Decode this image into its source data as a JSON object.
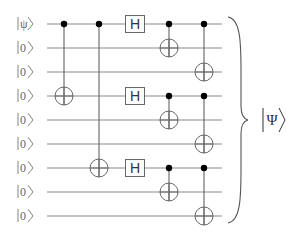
{
  "diagram": {
    "type": "quantum-circuit",
    "wire_y": [
      24,
      48,
      72,
      96,
      120,
      144,
      168,
      192,
      216
    ],
    "wire_x_start": 47,
    "wire_x_end": 222,
    "inputs": [
      "|ψ⟩",
      "|0⟩",
      "|0⟩",
      "|0⟩",
      "|0⟩",
      "|0⟩",
      "|0⟩",
      "|0⟩",
      "|0⟩"
    ],
    "input_label_parts": [
      {
        "sym": "ψ"
      },
      {
        "sym": "0"
      },
      {
        "sym": "0"
      },
      {
        "sym": "0"
      },
      {
        "sym": "0"
      },
      {
        "sym": "0"
      },
      {
        "sym": "0"
      },
      {
        "sym": "0"
      },
      {
        "sym": "0"
      }
    ],
    "columns": [
      {
        "x": 64,
        "gates": [
          {
            "type": "cnot",
            "control": 0,
            "target": 3
          }
        ]
      },
      {
        "x": 99,
        "gates": [
          {
            "type": "cnot",
            "control": 0,
            "target": 6
          }
        ]
      },
      {
        "x": 135,
        "gates": [
          {
            "type": "h",
            "wire": 0,
            "label": "H"
          },
          {
            "type": "h",
            "wire": 3,
            "label": "H"
          },
          {
            "type": "h",
            "wire": 6,
            "label": "H"
          }
        ]
      },
      {
        "x": 169,
        "gates": [
          {
            "type": "cnot",
            "control": 0,
            "target": 1
          },
          {
            "type": "cnot",
            "control": 3,
            "target": 4
          },
          {
            "type": "cnot",
            "control": 6,
            "target": 7
          }
        ]
      },
      {
        "x": 204,
        "gates": [
          {
            "type": "cnot",
            "control": 0,
            "target": 2
          },
          {
            "type": "cnot",
            "control": 3,
            "target": 5
          },
          {
            "type": "cnot",
            "control": 6,
            "target": 8
          }
        ]
      }
    ],
    "output": {
      "label": "|Ψ⟩",
      "symbol": "Ψ"
    },
    "colors": {
      "wire": "#8a8a8a",
      "control": "#000000",
      "gate_stroke": "#666666",
      "label": "#666666"
    }
  }
}
